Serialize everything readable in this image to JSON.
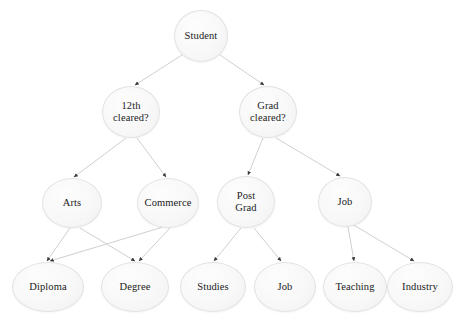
{
  "diagram": {
    "type": "tree-diagram",
    "canvas": {
      "width": 458,
      "height": 319
    },
    "style": {
      "node_fill": "#f8f8f8",
      "node_stroke": "#e2e2e2",
      "edge_color": "#c9c9c9",
      "arrow_color": "#3a3a3a",
      "label_color": "#1a1a1a",
      "background": "#ffffff"
    },
    "nodes": [
      {
        "id": "student",
        "label": "Student",
        "cx": 201,
        "cy": 36,
        "rx": 27,
        "ry": 26,
        "level": 0
      },
      {
        "id": "twelfth",
        "label": "12th\ncleared?",
        "cx": 131,
        "cy": 112,
        "rx": 29,
        "ry": 26,
        "level": 1
      },
      {
        "id": "grad",
        "label": "Grad\ncleared?",
        "cx": 268,
        "cy": 112,
        "rx": 29,
        "ry": 26,
        "level": 1
      },
      {
        "id": "arts",
        "label": "Arts",
        "cx": 72,
        "cy": 203,
        "rx": 30,
        "ry": 25,
        "level": 2
      },
      {
        "id": "commerce",
        "label": "Commerce",
        "cx": 168,
        "cy": 203,
        "rx": 31,
        "ry": 25,
        "level": 2
      },
      {
        "id": "postgrad",
        "label": "Post\nGrad",
        "cx": 246,
        "cy": 202,
        "rx": 29,
        "ry": 26,
        "level": 2
      },
      {
        "id": "job2",
        "label": "Job",
        "cx": 345,
        "cy": 202,
        "rx": 27,
        "ry": 25,
        "level": 2
      },
      {
        "id": "diploma",
        "label": "Diploma",
        "cx": 48,
        "cy": 287,
        "rx": 36,
        "ry": 25,
        "level": 3
      },
      {
        "id": "degree",
        "label": "Degree",
        "cx": 135,
        "cy": 287,
        "rx": 34,
        "ry": 25,
        "level": 3
      },
      {
        "id": "studies",
        "label": "Studies",
        "cx": 213,
        "cy": 287,
        "rx": 33,
        "ry": 25,
        "level": 3
      },
      {
        "id": "job3",
        "label": "Job",
        "cx": 285,
        "cy": 287,
        "rx": 31,
        "ry": 25,
        "level": 3
      },
      {
        "id": "teaching",
        "label": "Teaching",
        "cx": 355,
        "cy": 287,
        "rx": 32,
        "ry": 25,
        "level": 3
      },
      {
        "id": "industry",
        "label": "Industry",
        "cx": 420,
        "cy": 287,
        "rx": 33,
        "ry": 25,
        "level": 3
      }
    ],
    "edges": [
      {
        "id": "e1",
        "from": "student",
        "to": "twelfth",
        "x1": 182,
        "y1": 55,
        "x2": 135,
        "y2": 85
      },
      {
        "id": "e2",
        "from": "student",
        "to": "grad",
        "x1": 220,
        "y1": 55,
        "x2": 264,
        "y2": 85
      },
      {
        "id": "e3",
        "from": "twelfth",
        "to": "arts",
        "x1": 126,
        "y1": 138,
        "x2": 74,
        "y2": 177
      },
      {
        "id": "e4",
        "from": "twelfth",
        "to": "commerce",
        "x1": 137,
        "y1": 138,
        "x2": 166,
        "y2": 177
      },
      {
        "id": "e5",
        "from": "grad",
        "to": "postgrad",
        "x1": 263,
        "y1": 138,
        "x2": 248,
        "y2": 175
      },
      {
        "id": "e6",
        "from": "grad",
        "to": "job2",
        "x1": 276,
        "y1": 138,
        "x2": 340,
        "y2": 176
      },
      {
        "id": "e7",
        "from": "arts",
        "to": "diploma",
        "x1": 70,
        "y1": 228,
        "x2": 47,
        "y2": 261
      },
      {
        "id": "e8",
        "from": "arts",
        "to": "degree",
        "x1": 80,
        "y1": 228,
        "x2": 135,
        "y2": 261
      },
      {
        "id": "e9",
        "from": "commerce",
        "to": "diploma",
        "x1": 163,
        "y1": 227,
        "x2": 50,
        "y2": 261
      },
      {
        "id": "e10",
        "from": "commerce",
        "to": "degree",
        "x1": 170,
        "y1": 228,
        "x2": 139,
        "y2": 261
      },
      {
        "id": "e11",
        "from": "postgrad",
        "to": "studies",
        "x1": 241,
        "y1": 228,
        "x2": 214,
        "y2": 261
      },
      {
        "id": "e12",
        "from": "postgrad",
        "to": "job3",
        "x1": 254,
        "y1": 228,
        "x2": 281,
        "y2": 261
      },
      {
        "id": "e13",
        "from": "job2",
        "to": "teaching",
        "x1": 348,
        "y1": 227,
        "x2": 354,
        "y2": 261
      },
      {
        "id": "e14",
        "from": "job2",
        "to": "industry",
        "x1": 352,
        "y1": 224,
        "x2": 414,
        "y2": 261
      }
    ]
  }
}
